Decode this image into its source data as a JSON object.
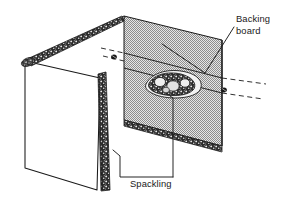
{
  "figure": {
    "background_color": "#ffffff",
    "line_color": "#1a1a1a",
    "board_fill_color": "#b9b9b9",
    "edge_texture_color": "#262626"
  },
  "labels": [
    {
      "id": "backing-board",
      "name": "backing-board-label",
      "lines": [
        "Backing",
        "board"
      ],
      "x": 236,
      "y": 22,
      "line_height": 12
    },
    {
      "id": "spackling",
      "name": "spackling-label",
      "lines": [
        "Spackling"
      ],
      "x": 130,
      "y": 187,
      "line_height": 12
    }
  ],
  "parts": [
    {
      "id": "wall-panel",
      "name": "existing-wall-panel",
      "description": "Existing drywall wall with torn opening edges"
    },
    {
      "id": "backing-board",
      "name": "backing-board-panel",
      "description": "Stippled gray backing board inserted behind the opening"
    },
    {
      "id": "spackling-blob",
      "name": "spackling-blob",
      "description": "Mound of spackling compound at center of backing board"
    },
    {
      "id": "screw-left",
      "name": "screw-head-left",
      "description": "Screw head fastening backing board, upper left"
    },
    {
      "id": "screw-right",
      "name": "screw-head-right",
      "description": "Screw head fastening backing board, lower right"
    },
    {
      "id": "string-dashes",
      "name": "support-string-dashed-lines",
      "description": "Dashed lines showing string/support path behind board"
    }
  ],
  "leaders": [
    {
      "id": "leader-backing-board",
      "name": "leader-line-backing-board",
      "from_label": "backing-board",
      "to_part": "backing-board"
    },
    {
      "id": "leader-spackling",
      "name": "leader-line-spackling",
      "from_label": "spackling",
      "to_part": "spackling-blob"
    },
    {
      "id": "leader-spackling-edge",
      "name": "leader-line-spackling-edge",
      "from_label": "spackling",
      "to_part": "wall-panel"
    }
  ]
}
